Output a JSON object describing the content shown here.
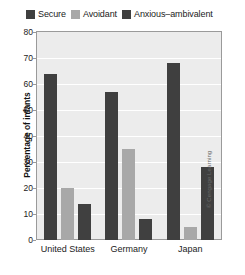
{
  "chart_data": {
    "type": "bar",
    "title": "",
    "xlabel": "",
    "ylabel": "Percentage of infants",
    "categories": [
      "United States",
      "Germany",
      "Japan"
    ],
    "series": [
      {
        "name": "Secure",
        "color": "#3f3f3f",
        "values": [
          64,
          57,
          68
        ]
      },
      {
        "name": "Avoidant",
        "color": "#a8a8a8",
        "values": [
          20,
          35,
          5
        ]
      },
      {
        "name": "Anxious–ambivalent",
        "color": "#404040",
        "values": [
          14,
          8,
          28
        ]
      }
    ],
    "ylim": [
      0,
      80
    ],
    "ytick_values": [
      80,
      70,
      60,
      50,
      40,
      30,
      20,
      10,
      0
    ],
    "ytick_labels": [
      "80",
      "70",
      "60",
      "50",
      "40",
      "30",
      "20",
      "10",
      "0"
    ],
    "grid": true,
    "legend_position": "top",
    "plot_background": "#ececec",
    "gridline_color": "#ffffff",
    "axis_color": "#9a9a9a"
  },
  "credit": {
    "text": "© Cengage Learning"
  }
}
